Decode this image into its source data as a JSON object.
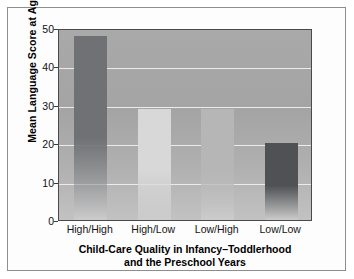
{
  "chart_data": {
    "type": "bar",
    "title": "",
    "xlabel": "Child-Care Quality in Infancy–Toddlerhood and the Preschool Years",
    "xlabel_line1": "Child-Care Quality in Infancy–Toddlerhood",
    "xlabel_line2": "and the Preschool Years",
    "ylabel": "Mean Language Score at Age 5",
    "categories": [
      "High/High",
      "High/Low",
      "Low/High",
      "Low/Low"
    ],
    "values": [
      48,
      29,
      29,
      20
    ],
    "ylim": [
      0,
      50
    ],
    "yticks": [
      0,
      10,
      20,
      30,
      40,
      50
    ],
    "ytick_labels": [
      "0",
      "10",
      "20",
      "30",
      "40",
      "50"
    ],
    "grid": true,
    "grid_color": "#eceaea",
    "legend": null,
    "legend_position": "none",
    "plot_background": "#a8a8a8",
    "bar_colors": [
      "#6f7175",
      "#d8d8d8",
      "#b6b6b6",
      "#4f5155"
    ],
    "bars": [
      {
        "category": "High/High",
        "value": 48,
        "color": "#6f7175"
      },
      {
        "category": "High/Low",
        "value": 29,
        "color": "#d8d8d8"
      },
      {
        "category": "Low/High",
        "value": 29,
        "color": "#b6b6b6"
      },
      {
        "category": "Low/Low",
        "value": 20,
        "color": "#4f5155"
      }
    ]
  },
  "figure": {
    "frame_color": "#8e8e8e",
    "axis_color": "#4a4a4a",
    "page_background": "#ffffff"
  }
}
